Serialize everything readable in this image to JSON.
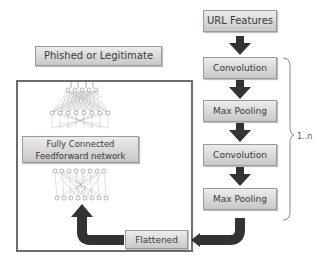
{
  "diagram": {
    "type": "CNN phishing URL classification pipeline",
    "nodes": {
      "output": "Phished or Legitimate",
      "input": "URL Features",
      "conv1": "Convolution",
      "pool1": "Max Pooling",
      "conv2": "Convolution",
      "pool2": "Max Pooling",
      "flatten": "Flattened",
      "fc": "Fully Connected Feedforward network"
    },
    "repeat_label": "1..n",
    "edges": [
      [
        "URL Features",
        "Convolution"
      ],
      [
        "Convolution",
        "Max Pooling"
      ],
      [
        "Max Pooling",
        "Convolution"
      ],
      [
        "Convolution",
        "Max Pooling"
      ],
      [
        "Max Pooling",
        "Flattened"
      ],
      [
        "Flattened",
        "Fully Connected Feedforward network"
      ],
      [
        "Fully Connected Feedforward network",
        "Phished or Legitimate"
      ]
    ],
    "colors": {
      "box_top": "#ececec",
      "box_bottom": "#c8c8c8",
      "arrow": "#333333",
      "frame": "#6d6d6d"
    }
  }
}
